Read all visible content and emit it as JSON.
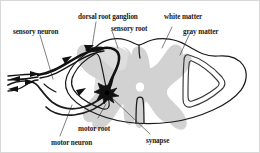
{
  "figure": {
    "type": "anatomical-diagram",
    "background_color": "#ffffff",
    "stroke_color": "#1b1b1b",
    "gray_matter_color": "#d2d2d2",
    "gray_matter_halo_color": "#dcdcdc",
    "white_matter_color": "#ffffff",
    "neuron_color": "#111111"
  },
  "labels": {
    "sensory_neuron": "sensory neuron",
    "dorsal_root_ganglion": "dorsal root ganglion",
    "sensory_root": "sensory root",
    "white_matter": "white matter",
    "gray_matter": "gray matter",
    "motor_root": "motor root",
    "motor_neuron": "motor neuron",
    "synapse": "synapse"
  },
  "structures": [
    {
      "name": "sensory-neuron",
      "label": "sensory neuron"
    },
    {
      "name": "dorsal-root-ganglion",
      "label": "dorsal root ganglion"
    },
    {
      "name": "sensory-root",
      "label": "sensory root"
    },
    {
      "name": "white-matter",
      "label": "white matter"
    },
    {
      "name": "gray-matter",
      "label": "gray matter"
    },
    {
      "name": "motor-root",
      "label": "motor root"
    },
    {
      "name": "motor-neuron",
      "label": "motor neuron"
    },
    {
      "name": "synapse",
      "label": "synapse"
    }
  ]
}
